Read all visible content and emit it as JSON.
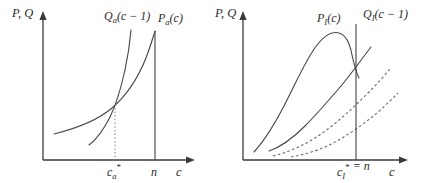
{
  "figure": {
    "panels": [
      {
        "id": "panel-a",
        "name": "autarky-panel",
        "y_axis_label": "P, Q",
        "x_axis_label": "c",
        "curves": [
          {
            "id": "Pa",
            "label_main": "P",
            "label_sub": "a",
            "label_arg": "(c)",
            "style": "solid"
          },
          {
            "id": "Qa",
            "label_main": "Q",
            "label_sub": "a",
            "label_arg": "(c − 1)",
            "style": "solid"
          }
        ],
        "x_ticks": [
          {
            "id": "c-star-a",
            "main": "c",
            "sub": "a",
            "star": "*"
          },
          {
            "id": "n",
            "main": "n",
            "sub": "",
            "star": ""
          }
        ],
        "vertical_line_at": "n",
        "drop_line_at": "c_a*"
      },
      {
        "id": "panel-i",
        "name": "integrated-panel",
        "y_axis_label": "P, Q",
        "x_axis_label": "c",
        "curves": [
          {
            "id": "PI",
            "label_main": "P",
            "label_sub": "I",
            "label_arg": "(c)",
            "style": "solid"
          },
          {
            "id": "QI",
            "label_main": "Q",
            "label_sub": "I",
            "label_arg": "(c − 1)",
            "style": "solid"
          },
          {
            "id": "dashed-upper",
            "label_main": "",
            "label_sub": "",
            "label_arg": "",
            "style": "dashed"
          },
          {
            "id": "dashed-lower",
            "label_main": "",
            "label_sub": "",
            "label_arg": "",
            "style": "dashed"
          }
        ],
        "x_ticks": [
          {
            "id": "c-star-I",
            "main": "c",
            "sub": "I",
            "star": "*",
            "suffix": " = n"
          }
        ],
        "vertical_line_at": "c_I* = n"
      }
    ],
    "colors": {
      "axis": "#3a3a3a",
      "curve": "#4a4a4a",
      "dashed": "#6a6a6a",
      "dropline": "#8e8e8e",
      "text": "#2b2b2b",
      "background": "#ffffff"
    }
  }
}
